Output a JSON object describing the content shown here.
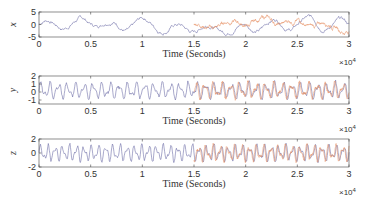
{
  "chart_data": [
    {
      "type": "line",
      "title": "",
      "xlabel": "Time (Seconds)",
      "ylabel": "x",
      "x_multiplier": "×10^4",
      "xlim": [
        0,
        3
      ],
      "ylim": [
        -5,
        5
      ],
      "xticks": [
        "0",
        "0.5",
        "1",
        "1.5",
        "2",
        "2.5",
        "3"
      ],
      "yticks": [
        "5",
        "0",
        "-5"
      ],
      "grid": false,
      "series": [
        {
          "name": "signal",
          "color": "#6e6ea8",
          "x_range": [
            0,
            3
          ],
          "amplitude": 3.5,
          "freq": 20
        },
        {
          "name": "estimate",
          "color": "#e8956b",
          "x_range": [
            1.5,
            3
          ],
          "amplitude": 2.5,
          "freq": 20
        }
      ]
    },
    {
      "type": "line",
      "title": "",
      "xlabel": "Time (Seconds)",
      "ylabel": "y",
      "x_multiplier": "×10^4",
      "xlim": [
        0,
        3
      ],
      "ylim": [
        -1.5,
        2
      ],
      "xticks": [
        "0",
        "0.5",
        "1",
        "1.5",
        "2",
        "2.5",
        "3"
      ],
      "yticks": [
        "2",
        "1",
        "0",
        "-1"
      ],
      "grid": false,
      "series": [
        {
          "name": "signal",
          "color": "#6e6ea8",
          "x_range": [
            0,
            3
          ],
          "amplitude": 1.2,
          "freq": 75
        },
        {
          "name": "estimate",
          "color": "#e8956b",
          "x_range": [
            1.5,
            3
          ],
          "amplitude": 1.2,
          "freq": 75
        }
      ]
    },
    {
      "type": "line",
      "title": "",
      "xlabel": "Time (Seconds)",
      "ylabel": "z",
      "x_multiplier": "×10^4",
      "xlim": [
        0,
        3
      ],
      "ylim": [
        -2,
        2
      ],
      "xticks": [
        "0",
        "0.5",
        "1",
        "1.5",
        "2",
        "2.5",
        "3"
      ],
      "yticks": [
        "2",
        "0",
        "-2"
      ],
      "grid": false,
      "series": [
        {
          "name": "signal",
          "color": "#6e6ea8",
          "x_range": [
            0,
            3
          ],
          "amplitude": 1.4,
          "freq": 90
        },
        {
          "name": "estimate",
          "color": "#e8956b",
          "x_range": [
            1.5,
            3
          ],
          "amplitude": 1.4,
          "freq": 90
        }
      ]
    }
  ],
  "layout": {
    "plot_left": 39,
    "plot_right": 349,
    "panels": [
      {
        "top": 12,
        "bottom": 37
      },
      {
        "top": 76,
        "bottom": 104
      },
      {
        "top": 139,
        "bottom": 167
      }
    ]
  }
}
